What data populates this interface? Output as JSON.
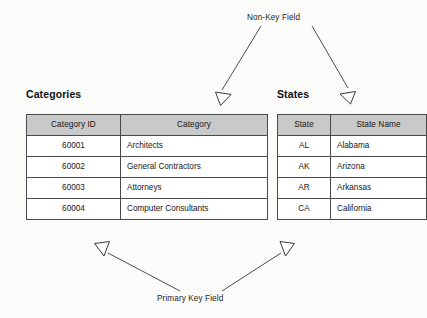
{
  "annotations": {
    "non_key_field": "Non-Key Field",
    "primary_key_field": "Primary Key Field"
  },
  "tables": [
    {
      "id": "categories",
      "title": "Categories",
      "columns": [
        "Category ID",
        "Category"
      ],
      "rows": [
        [
          "60001",
          "Architects"
        ],
        [
          "60002",
          "General Contractors"
        ],
        [
          "60003",
          "Attorneys"
        ],
        [
          "60004",
          "Computer Consultants"
        ]
      ]
    },
    {
      "id": "states",
      "title": "States",
      "columns": [
        "State",
        "State Name"
      ],
      "rows": [
        [
          "AL",
          "Alabama"
        ],
        [
          "AK",
          "Arizona"
        ],
        [
          "AR",
          "Arkansas"
        ],
        [
          "CA",
          "California"
        ]
      ]
    }
  ],
  "colors": {
    "header_fill": "#c9c9c9",
    "border": "#4a4a4a",
    "page_background": "#fbfbfa",
    "text": "#161616",
    "arrow_stroke": "#4d4d4d"
  }
}
